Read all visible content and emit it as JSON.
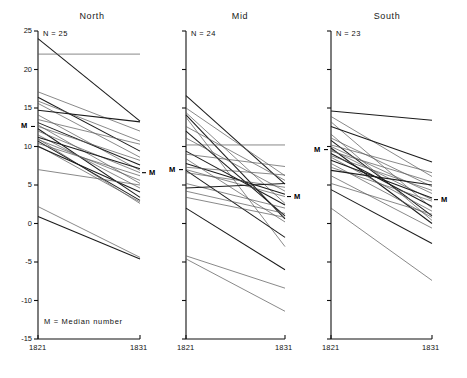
{
  "figure": {
    "footnote": "M = Median number",
    "x_axis": {
      "ticks": [
        "1821",
        "1831"
      ],
      "values": [
        1821,
        1831
      ]
    },
    "y_axis": {
      "ticks": [
        "25",
        "20",
        "15",
        "10",
        "5",
        "0",
        "-5",
        "-10",
        "-15"
      ],
      "values": [
        25,
        20,
        15,
        10,
        5,
        0,
        -5,
        -10,
        -15
      ],
      "ylim": [
        -15,
        25
      ]
    }
  },
  "chart_data": {
    "type": "line",
    "title": "",
    "subtitle": "",
    "xlabel": "",
    "ylabel": "",
    "x": [
      1821,
      1831
    ],
    "xlim": [
      1821,
      1831
    ],
    "ylim": [
      -15,
      25
    ],
    "grid": false,
    "legend": "none",
    "annotations": [
      "M = Median number",
      "N = 25",
      "N = 24",
      "N = 23"
    ],
    "panels": [
      {
        "name": "North",
        "title": "North",
        "n_label": "N = 25",
        "n": 25,
        "median_1821": 12.6,
        "median_1831": 6.6,
        "median_label": "M",
        "series": [
          {
            "name": "n1",
            "values": [
              24.0,
              13.3
            ]
          },
          {
            "name": "n2",
            "values": [
              22.0,
              22.0
            ]
          },
          {
            "name": "n3",
            "values": [
              17.1,
              12.0
            ]
          },
          {
            "name": "n4",
            "values": [
              16.4,
              9.4
            ]
          },
          {
            "name": "n5",
            "values": [
              15.9,
              10.7
            ]
          },
          {
            "name": "n6",
            "values": [
              15.6,
              8.6
            ]
          },
          {
            "name": "n7",
            "values": [
              14.7,
              13.2
            ]
          },
          {
            "name": "n8",
            "values": [
              14.1,
              6.9
            ]
          },
          {
            "name": "n9",
            "values": [
              13.5,
              10.3
            ]
          },
          {
            "name": "n10",
            "values": [
              13.1,
              7.6
            ]
          },
          {
            "name": "n11",
            "values": [
              12.8,
              5.2
            ]
          },
          {
            "name": "n12",
            "values": [
              12.6,
              8.2
            ]
          },
          {
            "name": "n13",
            "values": [
              12.3,
              3.4
            ]
          },
          {
            "name": "n14",
            "values": [
              12.0,
              6.6
            ]
          },
          {
            "name": "n15",
            "values": [
              11.5,
              4.6
            ]
          },
          {
            "name": "n16",
            "values": [
              11.2,
              7.1
            ]
          },
          {
            "name": "n17",
            "values": [
              11.0,
              2.6
            ]
          },
          {
            "name": "n18",
            "values": [
              10.9,
              5.6
            ]
          },
          {
            "name": "n19",
            "values": [
              10.7,
              3.0
            ]
          },
          {
            "name": "n20",
            "values": [
              10.4,
              6.2
            ]
          },
          {
            "name": "n21",
            "values": [
              10.1,
              2.8
            ]
          },
          {
            "name": "n22",
            "values": [
              10.0,
              4.1
            ]
          },
          {
            "name": "n23",
            "values": [
              7.0,
              5.0
            ]
          },
          {
            "name": "n24",
            "values": [
              2.2,
              -4.4
            ]
          },
          {
            "name": "n25",
            "values": [
              0.9,
              -4.6
            ]
          }
        ]
      },
      {
        "name": "Mid",
        "title": "Mid",
        "n_label": "N = 24",
        "n": 24,
        "median_1821": 7.0,
        "median_1831": 3.5,
        "median_label": "M",
        "series": [
          {
            "name": "m1",
            "values": [
              16.6,
              5.1
            ]
          },
          {
            "name": "m2",
            "values": [
              15.0,
              6.2
            ]
          },
          {
            "name": "m3",
            "values": [
              14.4,
              2.6
            ]
          },
          {
            "name": "m4",
            "values": [
              14.1,
              0.6
            ]
          },
          {
            "name": "m5",
            "values": [
              13.8,
              -3.0
            ]
          },
          {
            "name": "m6",
            "values": [
              12.6,
              5.6
            ]
          },
          {
            "name": "m7",
            "values": [
              12.0,
              1.0
            ]
          },
          {
            "name": "m8",
            "values": [
              11.1,
              4.2
            ]
          },
          {
            "name": "m9",
            "values": [
              10.2,
              10.2
            ]
          },
          {
            "name": "m10",
            "values": [
              9.4,
              2.4
            ]
          },
          {
            "name": "m11",
            "values": [
              9.0,
              7.4
            ]
          },
          {
            "name": "m12",
            "values": [
              8.4,
              0.2
            ]
          },
          {
            "name": "m13",
            "values": [
              7.8,
              3.8
            ]
          },
          {
            "name": "m14",
            "values": [
              7.3,
              6.3
            ]
          },
          {
            "name": "m15",
            "values": [
              7.0,
              3.5
            ]
          },
          {
            "name": "m16",
            "values": [
              6.9,
              -1.8
            ]
          },
          {
            "name": "m17",
            "values": [
              6.6,
              4.7
            ]
          },
          {
            "name": "m18",
            "values": [
              5.2,
              2.0
            ]
          },
          {
            "name": "m19",
            "values": [
              4.6,
              5.2
            ]
          },
          {
            "name": "m20",
            "values": [
              4.2,
              1.3
            ]
          },
          {
            "name": "m21",
            "values": [
              3.4,
              0.8
            ]
          },
          {
            "name": "m22",
            "values": [
              2.0,
              -6.0
            ]
          },
          {
            "name": "m23",
            "values": [
              -4.2,
              -8.4
            ]
          },
          {
            "name": "m24",
            "values": [
              -4.6,
              -11.4
            ]
          }
        ]
      },
      {
        "name": "South",
        "title": "South",
        "n_label": "N = 23",
        "n": 23,
        "median_1821": 9.6,
        "median_1831": 3.1,
        "median_label": "M",
        "series": [
          {
            "name": "s1",
            "values": [
              14.6,
              13.4
            ]
          },
          {
            "name": "s2",
            "values": [
              13.9,
              6.1
            ]
          },
          {
            "name": "s3",
            "values": [
              13.2,
              2.0
            ]
          },
          {
            "name": "s4",
            "values": [
              12.6,
              8.0
            ]
          },
          {
            "name": "s5",
            "values": [
              11.6,
              0.4
            ]
          },
          {
            "name": "s6",
            "values": [
              11.1,
              4.8
            ]
          },
          {
            "name": "s7",
            "values": [
              10.8,
              1.0
            ]
          },
          {
            "name": "s8",
            "values": [
              10.2,
              6.6
            ]
          },
          {
            "name": "s9",
            "values": [
              10.0,
              3.9
            ]
          },
          {
            "name": "s10",
            "values": [
              9.8,
              0.0
            ]
          },
          {
            "name": "s11",
            "values": [
              9.6,
              3.1
            ]
          },
          {
            "name": "s12",
            "values": [
              9.4,
              5.4
            ]
          },
          {
            "name": "s13",
            "values": [
              9.1,
              2.2
            ]
          },
          {
            "name": "s14",
            "values": [
              8.8,
              4.3
            ]
          },
          {
            "name": "s15",
            "values": [
              8.6,
              1.6
            ]
          },
          {
            "name": "s16",
            "values": [
              8.2,
              3.3
            ]
          },
          {
            "name": "s17",
            "values": [
              7.8,
              0.8
            ]
          },
          {
            "name": "s18",
            "values": [
              7.3,
              2.9
            ]
          },
          {
            "name": "s19",
            "values": [
              6.9,
              5.0
            ]
          },
          {
            "name": "s20",
            "values": [
              6.2,
              -0.6
            ]
          },
          {
            "name": "s21",
            "values": [
              5.2,
              1.2
            ]
          },
          {
            "name": "s22",
            "values": [
              4.4,
              -2.6
            ]
          },
          {
            "name": "s23",
            "values": [
              2.0,
              -7.4
            ]
          }
        ]
      }
    ]
  }
}
